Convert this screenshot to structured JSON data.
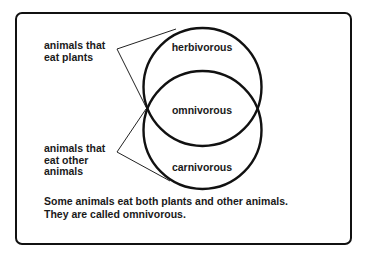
{
  "diagram": {
    "type": "venn",
    "left_labels": {
      "plants": [
        "animals that",
        "eat plants"
      ],
      "animals": [
        "animals that",
        "eat other",
        "animals"
      ]
    },
    "regions": {
      "top": "herbivorous",
      "overlap": "omnivorous",
      "bottom": "carnivorous"
    },
    "caption": [
      "Some animals eat both plants and other animals.",
      "They are called omnivorous."
    ],
    "colors": {
      "stroke": "#111111",
      "text": "#1a1a1a",
      "background": "#ffffff"
    }
  }
}
